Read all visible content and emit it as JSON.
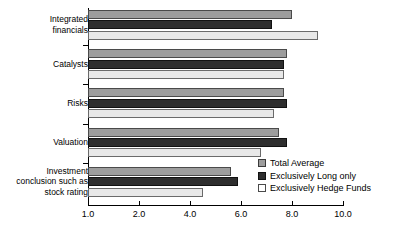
{
  "chart_data": {
    "type": "bar",
    "orientation": "horizontal",
    "title": "",
    "xlabel": "",
    "ylabel": "",
    "grid": false,
    "legend_position": "inside-right",
    "xtick_labels": [
      "1.0",
      "2.0",
      "4.0",
      "6.0",
      "8.0",
      "10.0"
    ],
    "xlim": [
      1.0,
      10.0
    ],
    "categories": [
      "Integrated\nfinancials",
      "Catalysts",
      "Risks",
      "Valuation",
      "Investment\nconclusion such as\nstock rating"
    ],
    "series": [
      {
        "name": "Total Average",
        "color": "#9d9d9d",
        "values": [
          8.0,
          7.8,
          7.7,
          7.5,
          5.6
        ]
      },
      {
        "name": "Exclusively Long only",
        "color": "#2e2e2e",
        "values": [
          7.2,
          7.7,
          7.8,
          7.8,
          5.9
        ]
      },
      {
        "name": "Exclusively Hedge Funds",
        "color": "#e8e8e8",
        "values": [
          9.0,
          7.7,
          7.3,
          6.8,
          4.5
        ]
      }
    ]
  },
  "legend": {
    "items": [
      {
        "label": "Total Average"
      },
      {
        "label": "Exclusively Long only"
      },
      {
        "label": "Exclusively Hedge Funds"
      }
    ]
  }
}
